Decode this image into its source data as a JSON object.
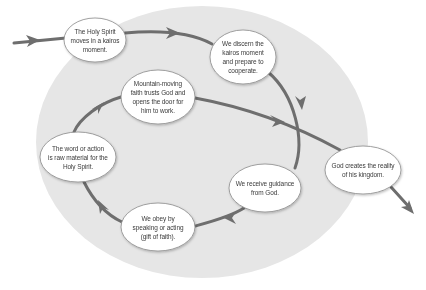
{
  "diagram": {
    "type": "cycle-flow",
    "colors": {
      "background": "#ffffff",
      "field": "#e6e6e6",
      "arrow": "#6e6e6e",
      "node_fill": "#ffffff",
      "node_stroke": "#8a8a8a",
      "text": "#3a3a3a"
    },
    "nodes": [
      {
        "id": "n1",
        "label": "The Holy Spirit moves in a kairos moment.",
        "lines": [
          "The Holy Spirit",
          "moves in a kairos",
          "moment."
        ],
        "cx": 95,
        "cy": 40,
        "rx": 31,
        "ry": 22
      },
      {
        "id": "n2",
        "label": "We discern the kairos moment and prepare to cooperate.",
        "lines": [
          "We discern the",
          "kairos moment",
          "and prepare to",
          "cooperate."
        ],
        "cx": 243,
        "cy": 57,
        "rx": 33,
        "ry": 27
      },
      {
        "id": "n3",
        "label": "Mountain-moving faith trusts God and opens the door for him to work.",
        "lines": [
          "Mountain-moving",
          "faith trusts God and",
          "opens the door for",
          "him to work."
        ],
        "cx": 158,
        "cy": 97,
        "rx": 37,
        "ry": 27
      },
      {
        "id": "n4",
        "label": "The word or action is raw material for the Holy Spirit.",
        "lines": [
          "The word or action",
          "is raw material for the",
          "Holy Spirit."
        ],
        "cx": 78,
        "cy": 157,
        "rx": 38,
        "ry": 25
      },
      {
        "id": "n5",
        "label": "We obey by speaking or acting (gift of faith).",
        "lines": [
          "We obey by",
          "speaking or acting",
          "(gift of faith)."
        ],
        "cx": 158,
        "cy": 227,
        "rx": 37,
        "ry": 24
      },
      {
        "id": "n6",
        "label": "We receive guidance from God.",
        "lines": [
          "We receive guidance",
          "from God."
        ],
        "cx": 265,
        "cy": 188,
        "rx": 36,
        "ry": 24
      },
      {
        "id": "n7",
        "label": "God creates the reality of his kingdom.",
        "lines": [
          "God creates the reality",
          "of his kingdom."
        ],
        "cx": 363,
        "cy": 170,
        "rx": 38,
        "ry": 24
      }
    ],
    "edges": [
      {
        "from": "entry",
        "to": "n1"
      },
      {
        "from": "n1",
        "to": "n2"
      },
      {
        "from": "n2",
        "to": "n6"
      },
      {
        "from": "n6",
        "to": "n5"
      },
      {
        "from": "n5",
        "to": "n4"
      },
      {
        "from": "n4",
        "to": "n3"
      },
      {
        "from": "n3",
        "to": "n7"
      },
      {
        "from": "n7",
        "to": "exit"
      }
    ]
  }
}
